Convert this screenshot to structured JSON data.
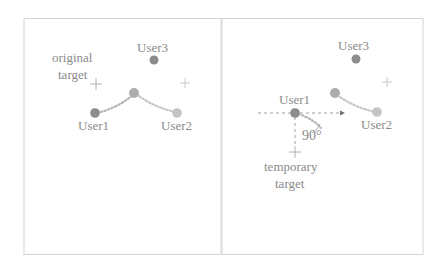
{
  "colors": {
    "frame": "#d4d4d4",
    "text": "#8a8a8a",
    "user_dark": "#8c8c8c",
    "user_mid": "#a8a8a8",
    "user_light": "#c2c2c2",
    "path": "#c4c4c4",
    "cross": "#b0b0b0",
    "axis": "#9a9a9a"
  },
  "left_panel": {
    "labels": {
      "user1": "User1",
      "user2": "User2",
      "user3": "User3",
      "original_line1": "original",
      "original_line2": "target"
    }
  },
  "right_panel": {
    "labels": {
      "user1": "User1",
      "user2": "User2",
      "user3": "User3",
      "angle": "90°",
      "temporary_line1": "temporary",
      "temporary_line2": "target"
    }
  }
}
